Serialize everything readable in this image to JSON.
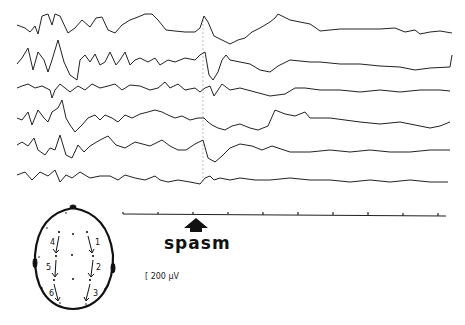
{
  "figure": {
    "type": "EEG recording",
    "event_label": "spasm",
    "scale_label": "200 µV",
    "scale_display": "[ 200 µV",
    "channel_count": 6,
    "time_axis_ticks": 10,
    "montage": {
      "description": "Head diagram with bipolar longitudinal derivations",
      "channels": [
        "1",
        "2",
        "3",
        "4",
        "5",
        "6"
      ]
    },
    "trace_color": "#222222",
    "arrow_color": "#111111"
  }
}
